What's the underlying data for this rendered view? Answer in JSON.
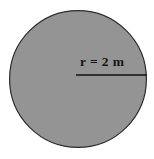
{
  "figure": {
    "type": "geometry-diagram",
    "shape": "circle",
    "background_color": "#ffffff",
    "canvas": {
      "width": 154,
      "height": 159
    },
    "circle": {
      "name": "shaded-circle",
      "center_x": 78,
      "center_y": 79,
      "radius": 69,
      "fill_color": "#949494",
      "stroke_color": "#2b2b2b",
      "stroke_width": 1.2
    },
    "radius_line": {
      "name": "radius-line",
      "x1": 76,
      "y1": 75,
      "x2": 147,
      "y2": 75,
      "stroke_color": "#101010",
      "stroke_width": 1.6
    },
    "radius_label": {
      "text": "r = 2 m",
      "variable": "r",
      "value": "2",
      "unit": "m",
      "color": "#161616"
    }
  }
}
